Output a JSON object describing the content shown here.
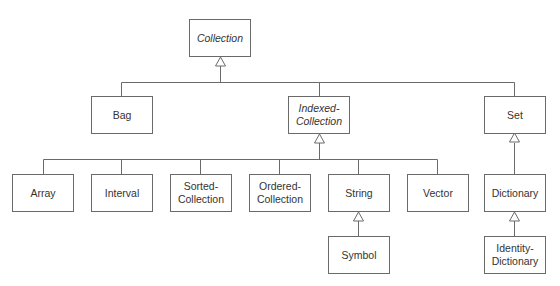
{
  "diagram": {
    "type": "class-hierarchy",
    "line_color": "#6a6a6a",
    "nodes": {
      "collection": {
        "label": "Collection",
        "abstract": true
      },
      "bag": {
        "label": "Bag",
        "abstract": false
      },
      "indexed_collection": {
        "label": "Indexed-\nCollection",
        "abstract": true
      },
      "set": {
        "label": "Set",
        "abstract": false
      },
      "array": {
        "label": "Array",
        "abstract": false
      },
      "interval": {
        "label": "Interval",
        "abstract": false
      },
      "sorted_collection": {
        "label": "Sorted-\nCollection",
        "abstract": false
      },
      "ordered_collection": {
        "label": "Ordered-\nCollection",
        "abstract": false
      },
      "string": {
        "label": "String",
        "abstract": false
      },
      "vector": {
        "label": "Vector",
        "abstract": false
      },
      "symbol": {
        "label": "Symbol",
        "abstract": false
      },
      "dictionary": {
        "label": "Dictionary",
        "abstract": false
      },
      "identity_dictionary": {
        "label": "Identity-\nDictionary",
        "abstract": false
      }
    },
    "edges": [
      {
        "from": "bag",
        "to": "collection",
        "kind": "inheritance"
      },
      {
        "from": "indexed_collection",
        "to": "collection",
        "kind": "inheritance"
      },
      {
        "from": "set",
        "to": "collection",
        "kind": "inheritance"
      },
      {
        "from": "array",
        "to": "indexed_collection",
        "kind": "inheritance"
      },
      {
        "from": "interval",
        "to": "indexed_collection",
        "kind": "inheritance"
      },
      {
        "from": "sorted_collection",
        "to": "indexed_collection",
        "kind": "inheritance"
      },
      {
        "from": "ordered_collection",
        "to": "indexed_collection",
        "kind": "inheritance"
      },
      {
        "from": "string",
        "to": "indexed_collection",
        "kind": "inheritance"
      },
      {
        "from": "vector",
        "to": "indexed_collection",
        "kind": "inheritance"
      },
      {
        "from": "symbol",
        "to": "string",
        "kind": "inheritance"
      },
      {
        "from": "dictionary",
        "to": "set",
        "kind": "inheritance"
      },
      {
        "from": "identity_dictionary",
        "to": "dictionary",
        "kind": "inheritance"
      }
    ]
  }
}
